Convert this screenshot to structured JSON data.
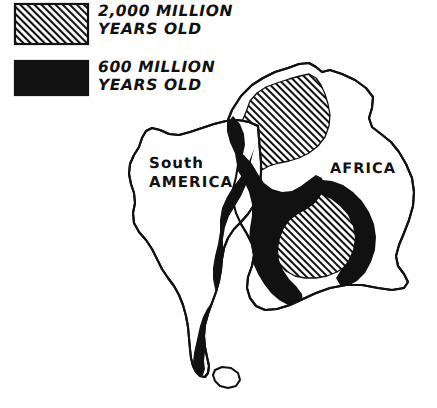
{
  "figure": {
    "background_color": "#ffffff",
    "ink_color": "#111111"
  },
  "legend": {
    "items": [
      {
        "id": "craton",
        "swatch": "diagonal-hatch-swatch",
        "pattern": "diagonal-hatch",
        "label": "2,000 MILLION\nYEARS OLD",
        "age_value": 2000,
        "age_unit": "million years"
      },
      {
        "id": "mobile-belt",
        "swatch": "solid-black-swatch",
        "pattern": "solid-black",
        "label": "600 MILLION\nYEARS OLD",
        "age_value": 600,
        "age_unit": "million years"
      }
    ]
  },
  "map": {
    "labels": [
      {
        "id": "south-america",
        "text": "South\nAMERICA"
      },
      {
        "id": "africa",
        "text": "AFRICA"
      }
    ],
    "regions": [
      {
        "id": "south-america-outline",
        "name": "South America landmass",
        "fill": "none"
      },
      {
        "id": "africa-outline",
        "name": "Africa landmass",
        "fill": "none"
      },
      {
        "id": "falkland-block",
        "name": "Small southern island block",
        "fill": "none"
      },
      {
        "id": "west-african-craton",
        "name": "West African craton",
        "fill": "diagonal-hatch"
      },
      {
        "id": "congo-craton",
        "name": "Congo craton",
        "fill": "diagonal-hatch"
      },
      {
        "id": "mobile-belt-main",
        "name": "Pan-African mobile belt",
        "fill": "solid-black"
      },
      {
        "id": "mobile-belt-southern",
        "name": "Southern mobile belt arm",
        "fill": "solid-black"
      }
    ]
  }
}
